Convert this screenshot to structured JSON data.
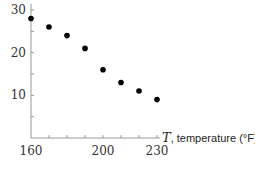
{
  "chart_data": {
    "type": "scatter",
    "title": "",
    "xlabel_var": "T",
    "xlabel": ", temperature (°F)",
    "ylabel": "",
    "xlim": [
      160,
      235
    ],
    "ylim": [
      0,
      32
    ],
    "xticks": [
      160,
      170,
      180,
      190,
      200,
      210,
      220,
      230
    ],
    "xtick_labels": [
      "160",
      "200",
      "230"
    ],
    "yticks": [
      5,
      10,
      15,
      20,
      25,
      30
    ],
    "ytick_labels": [
      "10",
      "20",
      "30"
    ],
    "grid": false,
    "legend": null,
    "x": [
      160,
      170,
      180,
      190,
      200,
      210,
      220,
      230
    ],
    "values": [
      28,
      26,
      24,
      21,
      16,
      13,
      11,
      9
    ]
  },
  "colors": {
    "axis": "#999999",
    "point": "#000000",
    "text": "#333333"
  }
}
